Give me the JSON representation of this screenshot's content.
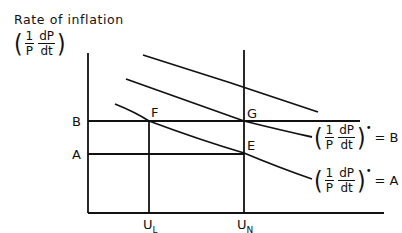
{
  "title": "Rate of inflation",
  "y_axis_label": {
    "num1": "1",
    "den1": "P",
    "num2": "dP",
    "den2": "dt"
  },
  "levels": [
    {
      "name": "B",
      "label": "B"
    },
    {
      "name": "A",
      "label": "A"
    }
  ],
  "points": {
    "F": "F",
    "G": "G",
    "E": "E"
  },
  "x_ticks": [
    {
      "main": "U",
      "sub": "L"
    },
    {
      "main": "U",
      "sub": "N"
    }
  ],
  "curve_labels": [
    {
      "num1": "1",
      "den1": "P",
      "num2": "dP",
      "den2": "dt",
      "star": "•",
      "eq": "= B"
    },
    {
      "num1": "1",
      "den1": "P",
      "num2": "dP",
      "den2": "dt",
      "star": "•",
      "eq": "= A"
    }
  ],
  "colors": {
    "line": "#111111",
    "background": "#ffffff"
  }
}
